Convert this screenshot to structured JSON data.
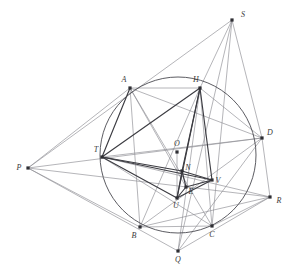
{
  "figure": {
    "background_color": "#ffffff",
    "stroke_light": "#8d8d93",
    "stroke_medium": "#6f6f76",
    "stroke_dark": "#3c3c42",
    "point_color": "#2e2e33",
    "label_color": "#3a3a3a",
    "circle": {
      "name": "circumcircle",
      "cx": 178,
      "cy": 155,
      "r": 78,
      "stroke": "#4a4a50",
      "stroke_width": 0.9
    },
    "points": [
      {
        "id": "A",
        "label": "A",
        "x": 130,
        "y": 88,
        "lx": 124,
        "ly": 82
      },
      {
        "id": "H",
        "label": "H",
        "x": 200,
        "y": 88,
        "lx": 196,
        "ly": 82
      },
      {
        "id": "D",
        "label": "D",
        "x": 262,
        "y": 138,
        "lx": 270,
        "ly": 135
      },
      {
        "id": "C",
        "label": "C",
        "x": 212,
        "y": 226,
        "lx": 212,
        "ly": 237
      },
      {
        "id": "B",
        "label": "B",
        "x": 140,
        "y": 227,
        "lx": 134,
        "ly": 238
      },
      {
        "id": "T",
        "label": "T",
        "x": 102,
        "y": 157,
        "lx": 96,
        "ly": 152
      },
      {
        "id": "O",
        "label": "O",
        "x": 177,
        "y": 152,
        "lx": 177,
        "ly": 146
      },
      {
        "id": "N",
        "label": "N",
        "x": 182,
        "y": 171,
        "lx": 188,
        "ly": 170
      },
      {
        "id": "V",
        "label": "V",
        "x": 212,
        "y": 180,
        "lx": 218,
        "ly": 183
      },
      {
        "id": "E",
        "label": "E",
        "x": 186,
        "y": 187,
        "lx": 191,
        "ly": 194
      },
      {
        "id": "U",
        "label": "U",
        "x": 177,
        "y": 198,
        "lx": 176,
        "ly": 208
      },
      {
        "id": "P",
        "label": "P",
        "x": 28,
        "y": 168,
        "lx": 19,
        "ly": 170
      },
      {
        "id": "Q",
        "label": "Q",
        "x": 178,
        "y": 251,
        "lx": 178,
        "ly": 262
      },
      {
        "id": "R",
        "label": "R",
        "x": 270,
        "y": 197,
        "lx": 279,
        "ly": 203
      },
      {
        "id": "S",
        "label": "S",
        "x": 232,
        "y": 20,
        "lx": 243,
        "ly": 17
      }
    ],
    "segments_light": [
      {
        "name": "segment-P-S",
        "from": "P",
        "to": "S"
      },
      {
        "name": "segment-P-A",
        "from": "P",
        "to": "A"
      },
      {
        "name": "segment-P-B",
        "from": "P",
        "to": "B"
      },
      {
        "name": "segment-P-Q",
        "from": "P",
        "to": "Q"
      },
      {
        "name": "segment-P-D",
        "from": "P",
        "to": "D"
      },
      {
        "name": "segment-P-R",
        "from": "P",
        "to": "R"
      },
      {
        "name": "segment-S-D",
        "from": "S",
        "to": "D"
      },
      {
        "name": "segment-S-C",
        "from": "S",
        "to": "C"
      },
      {
        "name": "segment-S-H",
        "from": "S",
        "to": "H"
      },
      {
        "name": "segment-S-Q",
        "from": "S",
        "to": "Q"
      },
      {
        "name": "segment-Q-D",
        "from": "Q",
        "to": "D"
      },
      {
        "name": "segment-Q-H",
        "from": "Q",
        "to": "H"
      },
      {
        "name": "segment-Q-R",
        "from": "Q",
        "to": "R"
      },
      {
        "name": "segment-R-D",
        "from": "R",
        "to": "D"
      },
      {
        "name": "segment-R-C",
        "from": "R",
        "to": "C"
      },
      {
        "name": "segment-R-B",
        "from": "R",
        "to": "B"
      },
      {
        "name": "segment-R-T",
        "from": "R",
        "to": "T"
      },
      {
        "name": "segment-A-B",
        "from": "A",
        "to": "B"
      },
      {
        "name": "segment-A-C",
        "from": "A",
        "to": "C"
      },
      {
        "name": "segment-A-D",
        "from": "A",
        "to": "D"
      },
      {
        "name": "segment-H-B",
        "from": "H",
        "to": "B"
      },
      {
        "name": "segment-H-C",
        "from": "H",
        "to": "C"
      },
      {
        "name": "segment-H-D",
        "from": "H",
        "to": "D"
      },
      {
        "name": "segment-B-D",
        "from": "B",
        "to": "D"
      },
      {
        "name": "segment-B-C",
        "from": "B",
        "to": "C"
      },
      {
        "name": "segment-A-H",
        "from": "A",
        "to": "H"
      },
      {
        "name": "segment-T-D",
        "from": "T",
        "to": "D"
      },
      {
        "name": "segment-T-C",
        "from": "T",
        "to": "C"
      },
      {
        "name": "segment-A-E",
        "from": "A",
        "to": "E"
      },
      {
        "name": "segment-O-U",
        "from": "O",
        "to": "U"
      }
    ],
    "segments_dark": [
      {
        "name": "segment-T-A",
        "from": "T",
        "to": "A"
      },
      {
        "name": "segment-T-H",
        "from": "T",
        "to": "H"
      },
      {
        "name": "segment-T-N",
        "from": "T",
        "to": "N"
      },
      {
        "name": "segment-T-U",
        "from": "T",
        "to": "U"
      },
      {
        "name": "segment-T-V",
        "from": "T",
        "to": "V"
      },
      {
        "name": "segment-H-V",
        "from": "H",
        "to": "V"
      },
      {
        "name": "segment-H-N",
        "from": "H",
        "to": "N"
      },
      {
        "name": "segment-H-U",
        "from": "H",
        "to": "U"
      },
      {
        "name": "segment-U-V",
        "from": "U",
        "to": "V"
      },
      {
        "name": "segment-U-N",
        "from": "U",
        "to": "N"
      },
      {
        "name": "segment-N-V",
        "from": "N",
        "to": "V"
      },
      {
        "name": "segment-E-V",
        "from": "E",
        "to": "V"
      },
      {
        "name": "segment-E-U",
        "from": "E",
        "to": "U"
      },
      {
        "name": "segment-E-N",
        "from": "E",
        "to": "N"
      }
    ]
  }
}
